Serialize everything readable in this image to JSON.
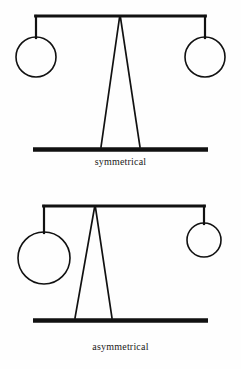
{
  "page": {
    "background_color": "#fefefe",
    "ink_color": "#111111",
    "width": 241,
    "height": 369
  },
  "figures": [
    {
      "id": "symmetrical",
      "caption": "symmetrical",
      "description": "balance scale with equal weights and centered fulcrum",
      "beam": {
        "y": 16,
        "x_left": 36,
        "x_right": 205,
        "thickness": 2.6
      },
      "fulcrum": {
        "apex_x": 120,
        "apex_y": 16,
        "base_left_x": 101,
        "base_right_x": 140,
        "base_y": 147
      },
      "base_bar": {
        "x_left": 33,
        "x_right": 208,
        "y": 149,
        "thickness": 4.5
      },
      "weights": [
        {
          "side": "left",
          "cx": 36,
          "cy": 57,
          "r": 20,
          "hanger_top_y": 16,
          "hanger_bottom_y": 37
        },
        {
          "side": "right",
          "cx": 205,
          "cy": 57,
          "r": 20,
          "hanger_top_y": 16,
          "hanger_bottom_y": 37
        }
      ]
    },
    {
      "id": "asymmetrical",
      "caption": "asymmetrical",
      "description": "balance scale with unequal weights and off-center fulcrum",
      "beam": {
        "y": 21,
        "x_left": 44,
        "x_right": 204,
        "thickness": 2.6
      },
      "fulcrum": {
        "apex_x": 95,
        "apex_y": 21,
        "base_left_x": 75,
        "base_right_x": 112,
        "base_y": 133
      },
      "base_bar": {
        "x_left": 33,
        "x_right": 208,
        "y": 135,
        "thickness": 4.5
      },
      "weights": [
        {
          "side": "left",
          "cx": 44,
          "cy": 73,
          "r": 26,
          "hanger_top_y": 21,
          "hanger_bottom_y": 47
        },
        {
          "side": "right",
          "cx": 204,
          "cy": 55,
          "r": 17,
          "hanger_top_y": 21,
          "hanger_bottom_y": 38
        }
      ]
    }
  ]
}
